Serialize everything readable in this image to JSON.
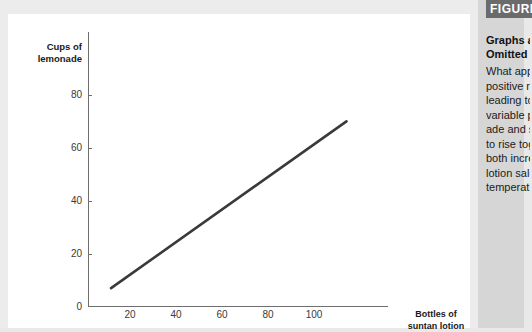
{
  "figure": {
    "tag": "FIGURE",
    "heading_lines": [
      "Graphs and",
      "Omitted Variables"
    ],
    "body_lines": [
      "What appears to be a",
      "positive relationship,",
      "leading to an omitted",
      "variable problem: lemon-",
      "ade and suntan lotion sales",
      "to rise together because",
      "both increase with",
      "lotion sales as",
      "temperature rises."
    ]
  },
  "chart_data": {
    "type": "line",
    "title": "",
    "xlabel": "Bottles of suntan lotion",
    "ylabel": "Cups of lemonade",
    "xlim": [
      0,
      130
    ],
    "ylim": [
      0,
      92
    ],
    "grid": false,
    "legend": "none",
    "xticks": [
      20,
      40,
      60,
      80,
      100
    ],
    "yticks": [
      0,
      20,
      40,
      60,
      80
    ],
    "series": [
      {
        "name": "lemonade vs suntan lotion",
        "color": "#3a3a3a",
        "x": [
          10,
          112
        ],
        "y": [
          6,
          62
        ]
      }
    ]
  },
  "axis": {
    "y_title_line1": "Cups of",
    "y_title_line2": "lemonade",
    "x_title_line1": "Bottles of",
    "x_title_line2": "suntan lotion",
    "y_tick_80": "80",
    "y_tick_60": "60",
    "y_tick_40": "40",
    "y_tick_20": "20",
    "y_tick_0": "0",
    "x_tick_20": "20",
    "x_tick_40": "40",
    "x_tick_60": "60",
    "x_tick_80": "80",
    "x_tick_100": "100"
  }
}
